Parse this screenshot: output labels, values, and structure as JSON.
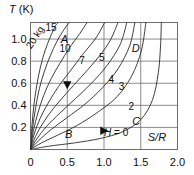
{
  "chart_data": {
    "type": "line",
    "title": "",
    "xlabel": "S/R",
    "ylabel": "T (K)",
    "xlim": [
      0,
      2.0
    ],
    "ylim": [
      0,
      1.15
    ],
    "grid": true,
    "legend_position": "inline-curve-labels",
    "xticks": [
      "0",
      "0.5",
      "1.0",
      "1.5",
      "2.0"
    ],
    "xtick_values": [
      0,
      0.5,
      1.0,
      1.5,
      2.0
    ],
    "yticks": [
      "0.2",
      "0.4",
      "0.6",
      "0.8",
      "1.0"
    ],
    "ytick_values": [
      0.2,
      0.4,
      0.6,
      0.8,
      1.0
    ],
    "series": [
      {
        "name": "20 kg",
        "label": "20 kg",
        "points": [
          [
            0.0,
            0.0
          ],
          [
            0.02,
            0.22
          ],
          [
            0.05,
            0.42
          ],
          [
            0.09,
            0.6
          ],
          [
            0.14,
            0.76
          ],
          [
            0.2,
            0.9
          ],
          [
            0.27,
            1.02
          ],
          [
            0.34,
            1.12
          ],
          [
            0.38,
            1.15
          ]
        ]
      },
      {
        "name": "15",
        "label": "15",
        "points": [
          [
            0.0,
            0.0
          ],
          [
            0.03,
            0.2
          ],
          [
            0.07,
            0.38
          ],
          [
            0.12,
            0.55
          ],
          [
            0.19,
            0.71
          ],
          [
            0.27,
            0.85
          ],
          [
            0.36,
            0.98
          ],
          [
            0.46,
            1.09
          ],
          [
            0.53,
            1.15
          ]
        ]
      },
      {
        "name": "10",
        "label": "10",
        "points": [
          [
            0.0,
            0.0
          ],
          [
            0.04,
            0.17
          ],
          [
            0.1,
            0.33
          ],
          [
            0.18,
            0.49
          ],
          [
            0.28,
            0.64
          ],
          [
            0.4,
            0.78
          ],
          [
            0.53,
            0.92
          ],
          [
            0.67,
            1.05
          ],
          [
            0.77,
            1.15
          ]
        ]
      },
      {
        "name": "7",
        "label": "7",
        "points": [
          [
            0.0,
            0.0
          ],
          [
            0.05,
            0.14
          ],
          [
            0.13,
            0.28
          ],
          [
            0.24,
            0.42
          ],
          [
            0.38,
            0.57
          ],
          [
            0.54,
            0.71
          ],
          [
            0.71,
            0.86
          ],
          [
            0.89,
            1.01
          ],
          [
            1.01,
            1.15
          ]
        ]
      },
      {
        "name": "5",
        "label": "5",
        "points": [
          [
            0.0,
            0.0
          ],
          [
            0.07,
            0.12
          ],
          [
            0.17,
            0.24
          ],
          [
            0.31,
            0.37
          ],
          [
            0.49,
            0.51
          ],
          [
            0.68,
            0.65
          ],
          [
            0.88,
            0.8
          ],
          [
            1.07,
            0.97
          ],
          [
            1.19,
            1.15
          ]
        ]
      },
      {
        "name": "4",
        "label": "4",
        "points": [
          [
            0.0,
            0.0
          ],
          [
            0.09,
            0.1
          ],
          [
            0.22,
            0.21
          ],
          [
            0.4,
            0.33
          ],
          [
            0.61,
            0.46
          ],
          [
            0.83,
            0.6
          ],
          [
            1.04,
            0.76
          ],
          [
            1.22,
            0.95
          ],
          [
            1.31,
            1.15
          ]
        ]
      },
      {
        "name": "3",
        "label": "3",
        "points": [
          [
            0.0,
            0.0
          ],
          [
            0.11,
            0.08
          ],
          [
            0.28,
            0.18
          ],
          [
            0.5,
            0.29
          ],
          [
            0.74,
            0.41
          ],
          [
            0.98,
            0.56
          ],
          [
            1.19,
            0.73
          ],
          [
            1.35,
            0.94
          ],
          [
            1.42,
            1.15
          ]
        ]
      },
      {
        "name": "2",
        "label": "2",
        "points": [
          [
            0.0,
            0.0
          ],
          [
            0.15,
            0.06
          ],
          [
            0.37,
            0.13
          ],
          [
            0.64,
            0.22
          ],
          [
            0.92,
            0.34
          ],
          [
            1.18,
            0.48
          ],
          [
            1.38,
            0.67
          ],
          [
            1.51,
            0.9
          ],
          [
            1.57,
            1.15
          ]
        ]
      },
      {
        "name": "H = 0",
        "label": "H = 0",
        "points": [
          [
            0.0,
            0.0
          ],
          [
            0.25,
            0.03
          ],
          [
            0.6,
            0.06
          ],
          [
            0.95,
            0.1
          ],
          [
            1.25,
            0.16
          ],
          [
            1.5,
            0.27
          ],
          [
            1.66,
            0.45
          ],
          [
            1.74,
            0.7
          ],
          [
            1.77,
            0.95
          ],
          [
            1.78,
            1.15
          ]
        ]
      }
    ],
    "curve_labels": [
      {
        "text": "20 kg",
        "x": 0.1,
        "y": 1.0,
        "rotation": -58,
        "name": "curve-label-20kg"
      },
      {
        "text": "15",
        "x": 0.28,
        "y": 1.07,
        "rotation": 0,
        "name": "curve-label-15"
      },
      {
        "text": "10",
        "x": 0.47,
        "y": 0.88,
        "rotation": 0,
        "name": "curve-label-10"
      },
      {
        "text": "7",
        "x": 0.7,
        "y": 0.77,
        "rotation": 0,
        "name": "curve-label-7"
      },
      {
        "text": "5",
        "x": 0.97,
        "y": 0.8,
        "rotation": 0,
        "name": "curve-label-5"
      },
      {
        "text": "4",
        "x": 1.1,
        "y": 0.6,
        "rotation": 0,
        "name": "curve-label-4"
      },
      {
        "text": "3",
        "x": 1.24,
        "y": 0.54,
        "rotation": 0,
        "name": "curve-label-3"
      },
      {
        "text": "2",
        "x": 1.37,
        "y": 0.36,
        "rotation": 0,
        "name": "curve-label-2"
      }
    ],
    "point_labels": [
      {
        "text": "A",
        "x": 0.46,
        "y": 0.96,
        "name": "point-label-a"
      },
      {
        "text": "B",
        "x": 0.52,
        "y": 0.1,
        "name": "point-label-b"
      },
      {
        "text": "C",
        "x": 1.44,
        "y": 0.22,
        "name": "point-label-c"
      },
      {
        "text": "D",
        "x": 1.43,
        "y": 0.88,
        "name": "point-label-d"
      }
    ],
    "annotations": [
      {
        "text": "H = 0",
        "x": 1.0,
        "y": 0.12,
        "italic_prefix": "H",
        "rest": " = 0",
        "name": "annotation-h-zero"
      },
      {
        "text": "S/R",
        "x": 1.72,
        "y": 0.08,
        "name": "annotation-s-over-r"
      }
    ],
    "markers": [
      {
        "shape": "triangle-down",
        "x": 0.5,
        "y": 0.58,
        "name": "marker-triangle-down"
      },
      {
        "shape": "triangle-right",
        "x": 1.0,
        "y": 0.17,
        "name": "marker-triangle-right"
      }
    ]
  },
  "axes": {
    "y_title_symbol": "T",
    "y_title_unit": " (K)",
    "x_inline_label": "S/R"
  },
  "colors": {
    "curve": "#2a2a2a",
    "frame": "#6d6d6d",
    "grid": "#6d6d6d",
    "text": "#101010",
    "background": "#ffffff"
  }
}
